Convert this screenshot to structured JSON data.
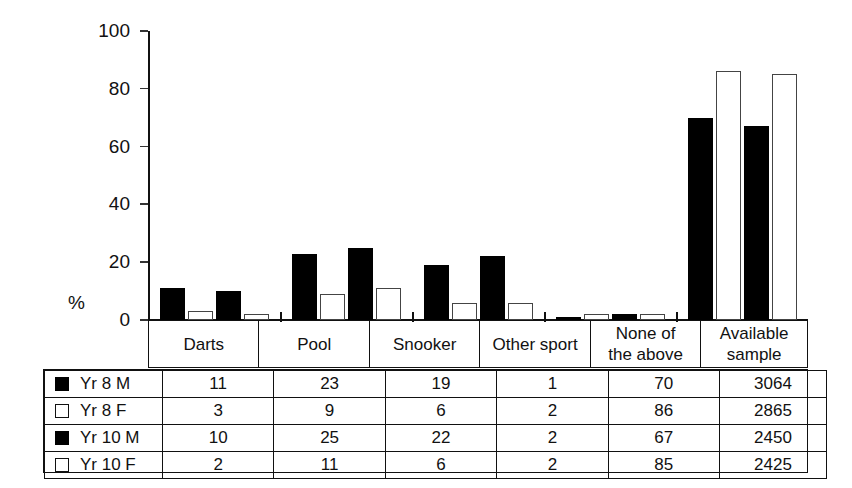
{
  "chart_data": {
    "type": "bar",
    "title": "",
    "subtitle": "",
    "xlabel": "",
    "ylabel": "%",
    "ylim": [
      0,
      100
    ],
    "yticks": [
      0,
      20,
      40,
      60,
      80,
      100
    ],
    "ytick_labels": [
      "0",
      "20",
      "40",
      "60",
      "80",
      "100"
    ],
    "grid": false,
    "legend_position": "table-below",
    "categories": [
      "Darts",
      "Pool",
      "Snooker",
      "Other sport",
      "None of the above"
    ],
    "category_lines": [
      [
        "Darts"
      ],
      [
        "Pool"
      ],
      [
        "Snooker"
      ],
      [
        "Other sport"
      ],
      [
        "None of",
        "the above"
      ]
    ],
    "extra_column": {
      "lines": [
        "Available",
        "sample"
      ],
      "values": [
        3064,
        2865,
        2450,
        2425
      ]
    },
    "series": [
      {
        "name": "Yr 8 M",
        "style": "solid",
        "values": [
          11,
          23,
          19,
          1,
          70
        ],
        "sample": 3064
      },
      {
        "name": "Yr 8 F",
        "style": "hollow",
        "values": [
          3,
          9,
          6,
          2,
          86
        ],
        "sample": 2865
      },
      {
        "name": "Yr 10 M",
        "style": "solid",
        "values": [
          10,
          25,
          22,
          2,
          67
        ],
        "sample": 2450
      },
      {
        "name": "Yr 10 F",
        "style": "hollow",
        "values": [
          2,
          11,
          6,
          2,
          85
        ],
        "sample": 2425
      }
    ],
    "colors": {
      "solid": "#000000",
      "hollow": "#ffffff",
      "outline": "#111111"
    }
  },
  "table": {
    "header_row": [
      "",
      "Darts",
      "Pool",
      "Snooker",
      "Other sport",
      "None of the above",
      "Available sample"
    ],
    "rows": [
      {
        "legend": "Yr 8 M",
        "style": "solid",
        "cells": [
          "11",
          "23",
          "19",
          "1",
          "70",
          "3064"
        ]
      },
      {
        "legend": "Yr 8 F",
        "style": "hollow",
        "cells": [
          "3",
          "9",
          "6",
          "2",
          "86",
          "2865"
        ]
      },
      {
        "legend": "Yr 10 M",
        "style": "solid",
        "cells": [
          "10",
          "25",
          "22",
          "2",
          "67",
          "2450"
        ]
      },
      {
        "legend": "Yr 10 F",
        "style": "hollow",
        "cells": [
          "2",
          "11",
          "6",
          "2",
          "85",
          "2425"
        ]
      }
    ]
  }
}
